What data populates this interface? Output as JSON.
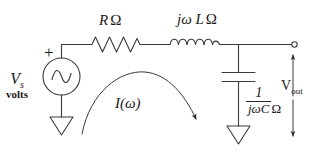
{
  "diagram": {
    "type": "electrical-circuit-schematic",
    "stroke_color": "#3a3a3a",
    "text_color": "#1a1a1a",
    "background_color": "#ffffff"
  },
  "labels": {
    "resistor": {
      "symbol": "R",
      "unit": "Ω",
      "full": "R Ω"
    },
    "inductor": {
      "symbol": "jω L",
      "unit": "Ω",
      "full": "jω L Ω"
    },
    "source": {
      "symbol": "V",
      "subscript": "s",
      "units_word": "volts"
    },
    "polarity_plus": "+",
    "current": "I(ω)",
    "capacitor": {
      "numerator": "1",
      "denominator": "jωC",
      "unit": "Ω"
    },
    "output": {
      "symbol": "V",
      "subscript": "out"
    }
  },
  "components": [
    {
      "name": "voltage-source",
      "kind": "ac-source",
      "label": "V_s volts"
    },
    {
      "name": "resistor",
      "kind": "resistor",
      "label": "R Ω"
    },
    {
      "name": "inductor",
      "kind": "inductor",
      "label": "jω L Ω"
    },
    {
      "name": "capacitor",
      "kind": "capacitor",
      "label": "1/(jωC) Ω"
    },
    {
      "name": "ground-left",
      "kind": "ground"
    },
    {
      "name": "ground-right",
      "kind": "ground"
    },
    {
      "name": "output-terminal",
      "kind": "open-terminal"
    }
  ]
}
